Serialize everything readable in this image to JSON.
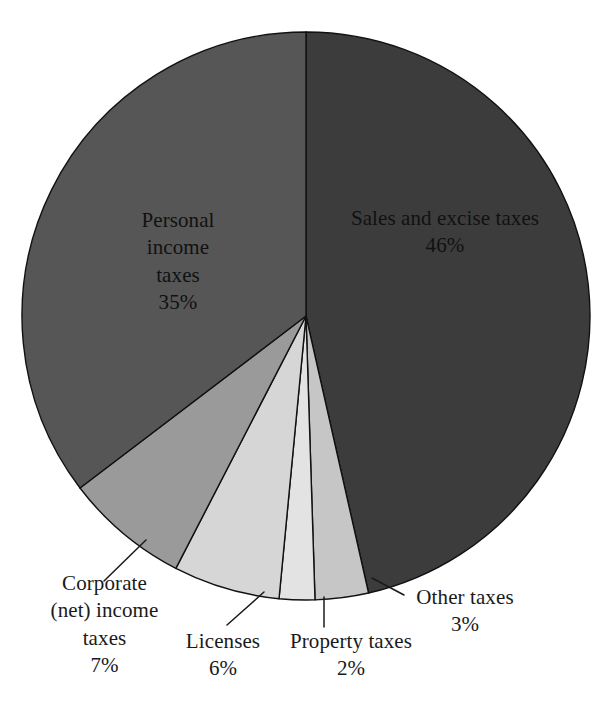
{
  "chart_data": {
    "type": "pie",
    "title": "",
    "subtitle": "",
    "xlabel": "",
    "ylabel": "",
    "legend_position": "none",
    "grid": false,
    "start_angle_deg": 0,
    "direction": "clockwise",
    "units": "percent",
    "categories": [
      "Sales and excise taxes",
      "Other taxes",
      "Property taxes",
      "Licenses",
      "Corporate (net) income taxes",
      "Personal income taxes"
    ],
    "values": [
      46,
      3,
      2,
      6,
      7,
      35
    ],
    "slices": [
      {
        "id": "sales",
        "label": "Sales and excise taxes",
        "label_lines": [
          "Sales and excise taxes"
        ],
        "value": 46,
        "value_text": "46%",
        "color": "#3c3c3c",
        "label_placement": "inside"
      },
      {
        "id": "other",
        "label": "Other taxes",
        "label_lines": [
          "Other taxes"
        ],
        "value": 3,
        "value_text": "3%",
        "color": "#c6c6c6",
        "label_placement": "outside"
      },
      {
        "id": "property",
        "label": "Property taxes",
        "label_lines": [
          "Property taxes"
        ],
        "value": 2,
        "value_text": "2%",
        "color": "#e3e3e3",
        "label_placement": "outside"
      },
      {
        "id": "licenses",
        "label": "Licenses",
        "label_lines": [
          "Licenses"
        ],
        "value": 6,
        "value_text": "6%",
        "color": "#d6d6d6",
        "label_placement": "outside"
      },
      {
        "id": "corporate",
        "label": "Corporate (net) income taxes",
        "label_lines": [
          "Corporate",
          "(net) income",
          "taxes"
        ],
        "value": 7,
        "value_text": "7%",
        "color": "#9a9a9a",
        "label_placement": "outside"
      },
      {
        "id": "personal",
        "label": "Personal income taxes",
        "label_lines": [
          "Personal",
          "income",
          "taxes"
        ],
        "value": 35,
        "value_text": "35%",
        "color": "#565656",
        "label_placement": "inside"
      }
    ]
  },
  "colors": {
    "background": "#ffffff",
    "outline": "#111111",
    "text": "#1a1a1a",
    "leader": "#1a1a1a"
  }
}
